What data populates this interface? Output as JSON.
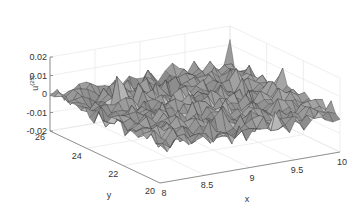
{
  "chart_data": {
    "type": "surface",
    "title": "",
    "xlabel": "x",
    "ylabel": "y",
    "zlabel": "u^(25)",
    "zlabel_base": "u",
    "zlabel_sup": "(25)",
    "xlim": [
      8,
      10
    ],
    "ylim": [
      20,
      26
    ],
    "zlim": [
      -0.02,
      0.02
    ],
    "xticks": [
      8,
      8.5,
      9,
      9.5,
      10
    ],
    "xtick_labels": [
      "8",
      "8.5",
      "9",
      "9.5",
      "10"
    ],
    "yticks": [
      20,
      22,
      24,
      26
    ],
    "ytick_labels": [
      "20",
      "22",
      "24",
      "26"
    ],
    "zticks": [
      -0.02,
      -0.01,
      0,
      0.01,
      0.02
    ],
    "ztick_labels": [
      "-0.02",
      "-0.01",
      "0",
      "0.01",
      "0.02"
    ],
    "grid": true,
    "colormap": "gray",
    "grid_size": [
      26,
      26
    ],
    "amplitude": 0.008
  },
  "colors": {
    "axis": "#7a7a7a",
    "grid": "#e6e6e6",
    "text": "#333333",
    "edge": "#3a3a3a"
  }
}
